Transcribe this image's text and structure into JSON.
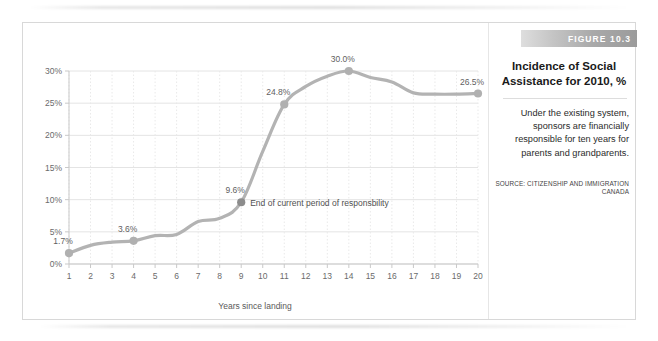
{
  "figure": {
    "number_label": "FIGURE 10.3",
    "title": "Incidence of Social Assistance for 2010, %",
    "description": "Under the existing system, sponsors are financially responsible for ten years for parents and grandparents.",
    "source": "SOURCE: CITIZENSHIP AND IMMIGRATION CANADA"
  },
  "colors": {
    "line": "#b3b3b3",
    "marker": "#b0b0b0",
    "marker_highlight": "#8c8c8c",
    "grid": "#e4e4e4",
    "grid_vertical": "#e9e9e9",
    "axis": "#c9c9c9",
    "tick_text": "#6b6b6b",
    "label_text": "#5f5f5f",
    "bar_gradient_start": "#dedede",
    "bar_gradient_end": "#9b9b9b",
    "bar_text": "#ffffff"
  },
  "chart_data": {
    "type": "line",
    "title": "Incidence of Social Assistance for 2010, %",
    "xlabel": "Years since landing",
    "ylabel": "",
    "xlim": [
      1,
      20
    ],
    "ylim": [
      0,
      30
    ],
    "grid": true,
    "legend": "none",
    "x": [
      1,
      2,
      3,
      4,
      5,
      6,
      7,
      8,
      9,
      10,
      11,
      12,
      13,
      14,
      15,
      16,
      17,
      18,
      19,
      20
    ],
    "x_tick_labels": [
      "1",
      "2",
      "3",
      "4",
      "5",
      "6",
      "7",
      "8",
      "9",
      "10",
      "11",
      "12",
      "13",
      "14",
      "15",
      "16",
      "17",
      "18",
      "19",
      "20"
    ],
    "y_tick_labels": [
      "0%",
      "5%",
      "10%",
      "15%",
      "20%",
      "25%",
      "30%"
    ],
    "y_ticks": [
      0,
      5,
      10,
      15,
      20,
      25,
      30
    ],
    "values": [
      1.7,
      2.9,
      3.4,
      3.6,
      4.4,
      4.6,
      6.6,
      7.1,
      9.6,
      17.5,
      24.8,
      27.6,
      29.2,
      30.0,
      29.0,
      28.3,
      26.6,
      26.4,
      26.4,
      26.5
    ],
    "point_labels": [
      {
        "x": 1,
        "y": 1.7,
        "text": "1.7%"
      },
      {
        "x": 4,
        "y": 3.6,
        "text": "3.6%"
      },
      {
        "x": 9,
        "y": 9.6,
        "text": "9.6%"
      },
      {
        "x": 11,
        "y": 24.8,
        "text": "24.8%"
      },
      {
        "x": 14,
        "y": 30.0,
        "text": "30.0%"
      },
      {
        "x": 20,
        "y": 26.5,
        "text": "26.5%"
      }
    ],
    "markers": [
      {
        "x": 1,
        "y": 1.7,
        "highlight": false
      },
      {
        "x": 4,
        "y": 3.6,
        "highlight": false
      },
      {
        "x": 9,
        "y": 9.6,
        "highlight": true
      },
      {
        "x": 11,
        "y": 24.8,
        "highlight": false
      },
      {
        "x": 14,
        "y": 30.0,
        "highlight": false
      },
      {
        "x": 20,
        "y": 26.5,
        "highlight": false
      }
    ],
    "annotations": [
      {
        "x": 9,
        "y": 9.6,
        "text": "End of current period of responsbility"
      }
    ]
  }
}
